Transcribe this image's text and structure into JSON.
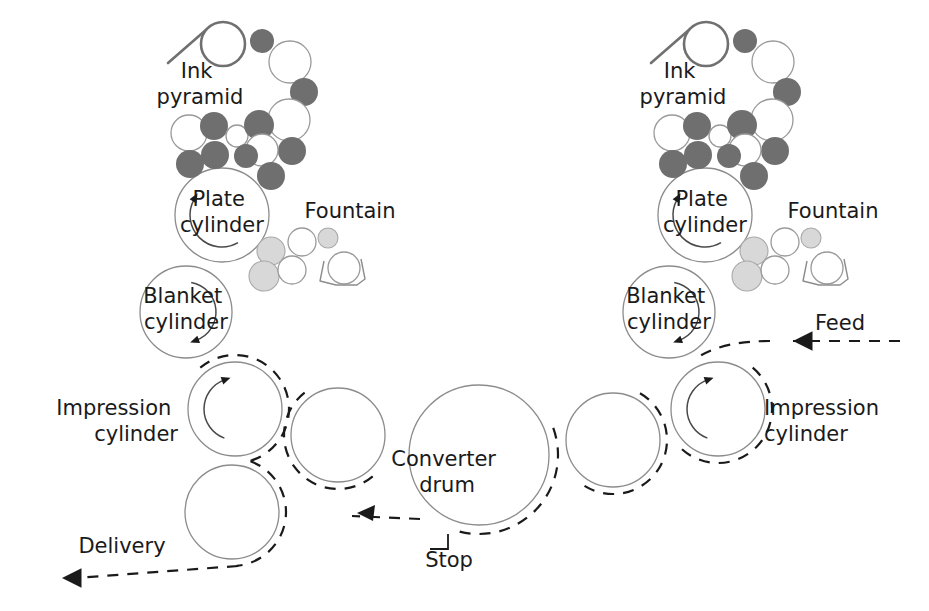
{
  "diagram": {
    "background": "#ffffff",
    "colors": {
      "ink_dark": "#6f6f6f",
      "ink_white": "#ffffff",
      "fountain_light": "#d8d8d8",
      "cylinder_stroke": "#8c8c8c",
      "paper_path": "#1a1a1a",
      "text": "#1a1a1a"
    },
    "labels": {
      "ink_pyramid_left": {
        "line1": "Ink",
        "line2": "pyramid",
        "x": 200,
        "y": 78,
        "anchor": "middle"
      },
      "ink_pyramid_right": {
        "line1": "Ink",
        "line2": "pyramid",
        "x": 683,
        "y": 78,
        "anchor": "middle"
      },
      "plate_cylinder_left": {
        "line1": "Plate",
        "line2": "cylinder",
        "x": 222,
        "y": 206,
        "anchor": "middle"
      },
      "plate_cylinder_right": {
        "line1": "Plate",
        "line2": "cylinder",
        "x": 705,
        "y": 206,
        "anchor": "middle"
      },
      "fountain_left": {
        "line1": "Fountain",
        "x": 350,
        "y": 218,
        "anchor": "middle"
      },
      "fountain_right": {
        "line1": "Fountain",
        "x": 833,
        "y": 218,
        "anchor": "middle"
      },
      "blanket_cylinder_left": {
        "line1": "Blanket",
        "line2": "cylinder",
        "x": 186,
        "y": 303,
        "anchor": "middle"
      },
      "blanket_cylinder_right": {
        "line1": "Blanket",
        "line2": "cylinder",
        "x": 669,
        "y": 303,
        "anchor": "middle"
      },
      "impression_cylinder_left": {
        "line1": "Impression",
        "line2": "cylinder",
        "x": 178,
        "y": 415,
        "anchor": "end"
      },
      "impression_cylinder_right": {
        "line1": "Impression",
        "line2": "cylinder",
        "x": 764,
        "y": 415,
        "anchor": "start"
      },
      "converter_drum": {
        "line1": "Converter",
        "line2": "drum",
        "x": 447,
        "y": 466,
        "anchor": "middle"
      },
      "feed": {
        "line1": "Feed",
        "x": 840,
        "y": 330,
        "anchor": "middle"
      },
      "delivery": {
        "line1": "Delivery",
        "x": 122,
        "y": 553,
        "anchor": "middle"
      },
      "stop": {
        "line1": "Stop",
        "x": 449,
        "y": 567,
        "anchor": "middle"
      }
    },
    "units": [
      {
        "name": "left-print-unit",
        "mirrored": false,
        "plate_cylinder": {
          "cx": 222,
          "cy": 215,
          "r": 47
        },
        "blanket_cylinder": {
          "cx": 186,
          "cy": 312,
          "r": 46
        },
        "impression_cylinder": {
          "cx": 235,
          "cy": 409,
          "r": 47
        },
        "ink_duct": {
          "cx": 223,
          "cy": 44,
          "r": 22
        },
        "blade": {
          "x1": 207,
          "y1": 29,
          "x2": 168,
          "y2": 63
        },
        "ink_rollers": [
          {
            "cx": 262,
            "cy": 41,
            "r": 12,
            "tone": "dark"
          },
          {
            "cx": 290,
            "cy": 62,
            "r": 21,
            "tone": "white"
          },
          {
            "cx": 304,
            "cy": 92,
            "r": 14,
            "tone": "dark"
          },
          {
            "cx": 289,
            "cy": 120,
            "r": 21,
            "tone": "white"
          },
          {
            "cx": 292,
            "cy": 151,
            "r": 14,
            "tone": "dark"
          },
          {
            "cx": 189,
            "cy": 133,
            "r": 18,
            "tone": "white"
          },
          {
            "cx": 214,
            "cy": 126,
            "r": 14,
            "tone": "dark"
          },
          {
            "cx": 237,
            "cy": 136,
            "r": 11,
            "tone": "white"
          },
          {
            "cx": 259,
            "cy": 125,
            "r": 15,
            "tone": "dark"
          },
          {
            "cx": 215,
            "cy": 155,
            "r": 14,
            "tone": "dark"
          },
          {
            "cx": 262,
            "cy": 150,
            "r": 16,
            "tone": "white"
          },
          {
            "cx": 246,
            "cy": 156,
            "r": 12,
            "tone": "dark"
          },
          {
            "cx": 190,
            "cy": 164,
            "r": 14,
            "tone": "dark"
          },
          {
            "cx": 271,
            "cy": 176,
            "r": 14,
            "tone": "dark"
          }
        ],
        "fountain_rollers": [
          {
            "cx": 271,
            "cy": 251,
            "r": 14,
            "tone": "light"
          },
          {
            "cx": 302,
            "cy": 242,
            "r": 14,
            "tone": "white"
          },
          {
            "cx": 328,
            "cy": 238,
            "r": 10,
            "tone": "light"
          },
          {
            "cx": 264,
            "cy": 276,
            "r": 15,
            "tone": "light"
          },
          {
            "cx": 292,
            "cy": 270,
            "r": 14,
            "tone": "white"
          },
          {
            "cx": 344,
            "cy": 268,
            "r": 16,
            "tone": "white"
          }
        ],
        "trough": {
          "points": "324,261 320,281 336,285 357,285 365,279 361,259"
        },
        "rot_arrows": [
          {
            "cx": 222,
            "cy": 215,
            "r": 32,
            "start": 150,
            "end": 300,
            "head_at": 300
          },
          {
            "cx": 186,
            "cy": 312,
            "r": 30,
            "start": 10,
            "end": 160,
            "head_at": 160
          },
          {
            "cx": 235,
            "cy": 409,
            "r": 31,
            "start": 200,
            "end": 340,
            "head_at": 340
          }
        ]
      },
      {
        "name": "right-print-unit",
        "mirrored": false,
        "plate_cylinder": {
          "cx": 705,
          "cy": 215,
          "r": 47
        },
        "blanket_cylinder": {
          "cx": 669,
          "cy": 312,
          "r": 46
        },
        "impression_cylinder": {
          "cx": 718,
          "cy": 409,
          "r": 47
        },
        "ink_duct": {
          "cx": 706,
          "cy": 44,
          "r": 22
        },
        "blade": {
          "x1": 690,
          "y1": 29,
          "x2": 651,
          "y2": 63
        },
        "ink_rollers": [
          {
            "cx": 745,
            "cy": 41,
            "r": 12,
            "tone": "dark"
          },
          {
            "cx": 773,
            "cy": 62,
            "r": 21,
            "tone": "white"
          },
          {
            "cx": 787,
            "cy": 92,
            "r": 14,
            "tone": "dark"
          },
          {
            "cx": 772,
            "cy": 120,
            "r": 21,
            "tone": "white"
          },
          {
            "cx": 775,
            "cy": 151,
            "r": 14,
            "tone": "dark"
          },
          {
            "cx": 672,
            "cy": 133,
            "r": 18,
            "tone": "white"
          },
          {
            "cx": 697,
            "cy": 126,
            "r": 14,
            "tone": "dark"
          },
          {
            "cx": 720,
            "cy": 136,
            "r": 11,
            "tone": "white"
          },
          {
            "cx": 742,
            "cy": 125,
            "r": 15,
            "tone": "dark"
          },
          {
            "cx": 698,
            "cy": 155,
            "r": 14,
            "tone": "dark"
          },
          {
            "cx": 745,
            "cy": 150,
            "r": 16,
            "tone": "white"
          },
          {
            "cx": 729,
            "cy": 156,
            "r": 12,
            "tone": "dark"
          },
          {
            "cx": 673,
            "cy": 164,
            "r": 14,
            "tone": "dark"
          },
          {
            "cx": 754,
            "cy": 176,
            "r": 14,
            "tone": "dark"
          }
        ],
        "fountain_rollers": [
          {
            "cx": 754,
            "cy": 251,
            "r": 14,
            "tone": "light"
          },
          {
            "cx": 785,
            "cy": 242,
            "r": 14,
            "tone": "white"
          },
          {
            "cx": 811,
            "cy": 238,
            "r": 10,
            "tone": "light"
          },
          {
            "cx": 747,
            "cy": 276,
            "r": 15,
            "tone": "light"
          },
          {
            "cx": 775,
            "cy": 270,
            "r": 14,
            "tone": "white"
          },
          {
            "cx": 827,
            "cy": 268,
            "r": 16,
            "tone": "white"
          }
        ],
        "trough": {
          "points": "807,261 803,281 819,285 840,285 848,279 844,259"
        },
        "rot_arrows": [
          {
            "cx": 705,
            "cy": 215,
            "r": 32,
            "start": 150,
            "end": 300,
            "head_at": 300
          },
          {
            "cx": 669,
            "cy": 312,
            "r": 30,
            "start": 10,
            "end": 160,
            "head_at": 160
          },
          {
            "cx": 718,
            "cy": 409,
            "r": 31,
            "start": 200,
            "end": 340,
            "head_at": 340
          }
        ]
      }
    ],
    "transfer_cylinders": [
      {
        "name": "transfer-cylinder-left",
        "cx": 338,
        "cy": 435,
        "r": 47
      },
      {
        "name": "transfer-cylinder-right",
        "cx": 613,
        "cy": 440,
        "r": 47
      },
      {
        "name": "delivery-cylinder",
        "cx": 232,
        "cy": 512,
        "r": 47
      }
    ],
    "converter_drum": {
      "cx": 479,
      "cy": 455,
      "r": 70
    },
    "paper_path": {
      "feed_arrow": {
        "tip_x": 793,
        "tip_y": 341,
        "dir": "left"
      },
      "delivery_arrow": {
        "tip_x": 62,
        "tip_y": 578,
        "dir": "left"
      },
      "mid_arrow": {
        "tip_x": 357,
        "tip_y": 513,
        "dir": "down-left"
      }
    },
    "stop_bracket": {
      "points": "430,549 448,549 448,534"
    }
  }
}
